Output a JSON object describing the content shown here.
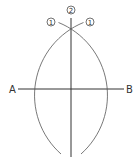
{
  "diagram": {
    "labels": {
      "point_a": "A",
      "point_b": "B",
      "step_1_left": "1",
      "step_2": "2",
      "step_1_right": "1"
    },
    "colors": {
      "line": "#333333",
      "arc": "#555555",
      "text": "#333333",
      "background": "#ffffff"
    }
  }
}
